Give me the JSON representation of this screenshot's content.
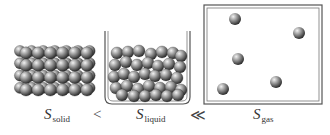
{
  "diagram": {
    "panels": [
      {
        "id": "solid",
        "state": "solid",
        "description": "Closely packed ordered lattice of spheres"
      },
      {
        "id": "liquid",
        "state": "liquid",
        "description": "Disordered closely packed spheres in open beaker"
      },
      {
        "id": "gas",
        "state": "gas",
        "description": "Few widely spaced spheres in closed box",
        "particle_count": 5
      }
    ],
    "labels": {
      "solid": {
        "symbol": "S",
        "subscript": "solid"
      },
      "liquid": {
        "symbol": "S",
        "subscript": "liquid"
      },
      "gas": {
        "symbol": "S",
        "subscript": "gas"
      }
    },
    "operators": {
      "first": "<",
      "second": "≪"
    },
    "colors": {
      "particle_light": "#d9d9d9",
      "particle_dark": "#3a3a3a",
      "container_stroke": "#555555"
    }
  }
}
